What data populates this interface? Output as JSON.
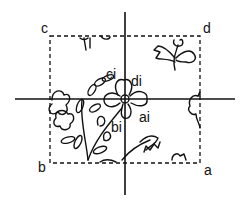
{
  "diagram": {
    "type": "patent-style tiling figure",
    "corner_labels": {
      "top_left": "c",
      "top_right": "d",
      "bottom_left": "b",
      "bottom_right": "a"
    },
    "center_labels": {
      "upper_left": "ci",
      "upper_right": "di",
      "lower_right": "ai",
      "lower_left": "bi"
    },
    "elements": {
      "crosshair": "vertical and horizontal axes crossing at flower center",
      "frame": "dashed rectangle",
      "artwork": "floral line drawing with leaves and blossoms"
    },
    "colors": {
      "ink": "#111111",
      "background": "#ffffff"
    }
  }
}
